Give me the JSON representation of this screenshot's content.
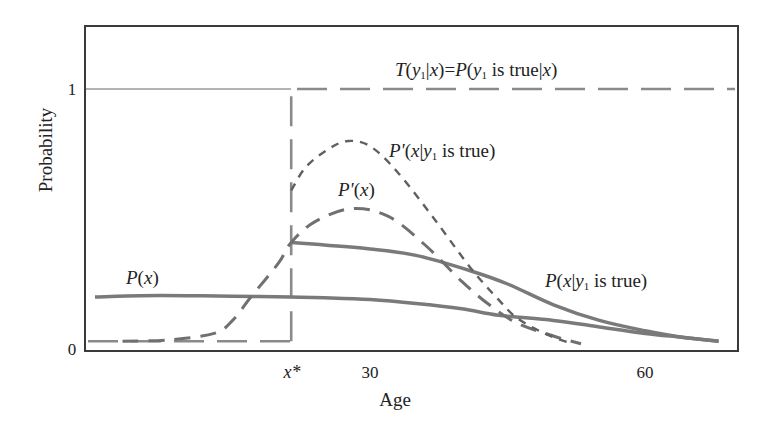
{
  "chart_data": {
    "type": "line",
    "title": "",
    "xlabel": "Age",
    "ylabel": "Probability",
    "xlim": [
      -1,
      70
    ],
    "ylim": [
      0,
      1.25
    ],
    "grid": false,
    "legend_position": "inline labels",
    "x_ticks": [
      {
        "value": 21.4,
        "label": "x*"
      },
      {
        "value": 30,
        "label": "30"
      },
      {
        "value": 60,
        "label": "60"
      }
    ],
    "y_ticks": [
      {
        "value": 0,
        "label": "0"
      },
      {
        "value": 1,
        "label": "1"
      }
    ],
    "annotations": {
      "x_star": 21.4
    },
    "series": [
      {
        "name": "T(y1|x)=P(y1 is true|x)",
        "style": "long-dash step",
        "color": "#8a8a8a",
        "x": [
          0,
          21.4,
          21.4,
          70
        ],
        "y": [
          0.03,
          0.03,
          1.0,
          1.0
        ]
      },
      {
        "name": "P(x)",
        "style": "solid",
        "color": "#7a7a7a",
        "x": [
          0,
          5,
          10,
          15,
          21.4,
          25,
          30,
          35,
          40,
          44,
          50,
          55,
          60,
          64,
          68
        ],
        "y": [
          0.2,
          0.205,
          0.205,
          0.203,
          0.2,
          0.197,
          0.19,
          0.175,
          0.155,
          0.13,
          0.11,
          0.085,
          0.06,
          0.045,
          0.03
        ]
      },
      {
        "name": "P(x|y1 is true)",
        "style": "solid",
        "color": "#7a7a7a",
        "x": [
          21.4,
          25,
          30,
          35,
          41,
          45,
          50,
          55,
          60,
          64,
          68
        ],
        "y": [
          0.41,
          0.4,
          0.385,
          0.36,
          0.3,
          0.25,
          0.17,
          0.11,
          0.07,
          0.045,
          0.03
        ]
      },
      {
        "name": "P'(x)",
        "style": "long-dash",
        "color": "#707070",
        "x": [
          3,
          8,
          13,
          15,
          17,
          20,
          21.4,
          24,
          28,
          32,
          36,
          40,
          43,
          46,
          50,
          53
        ],
        "y": [
          0.03,
          0.035,
          0.06,
          0.11,
          0.2,
          0.33,
          0.41,
          0.49,
          0.54,
          0.51,
          0.4,
          0.26,
          0.17,
          0.1,
          0.05,
          0.02
        ]
      },
      {
        "name": "P'(x|y1 is true)",
        "style": "short-dash",
        "color": "#606060",
        "x": [
          21.4,
          23,
          25.5,
          27.6,
          30,
          33,
          37,
          41,
          44,
          46,
          49,
          52
        ],
        "y": [
          0.61,
          0.7,
          0.77,
          0.8,
          0.78,
          0.68,
          0.5,
          0.31,
          0.19,
          0.12,
          0.06,
          0.02
        ]
      }
    ],
    "labels": {
      "T_label": {
        "parts": [
          "T",
          "(",
          "y",
          "1",
          "|",
          "x",
          ")=",
          "P",
          "(",
          "y",
          "1",
          " is true|",
          "x",
          ")"
        ]
      },
      "p_prime_cond_label": "P'(x|y1 is true)",
      "p_prime_label": "P'(x)",
      "p_label": "P(x)",
      "p_cond_label": "P(x|y1 is true)"
    }
  },
  "axes": {
    "xlabel": "Age",
    "ylabel": "Probability",
    "tick_x_star": "x*",
    "tick_x_30": "30",
    "tick_x_60": "60",
    "tick_y_0": "0",
    "tick_y_1": "1"
  },
  "text": {
    "T": "T",
    "y": "y",
    "sub1": "1",
    "x": "x",
    "P": "P",
    "Pp": "P'",
    "open": "(",
    "close": ")",
    "bar": "|",
    "eq": ")=",
    "is_true": " is true",
    "is_true_bar": " is true|"
  }
}
